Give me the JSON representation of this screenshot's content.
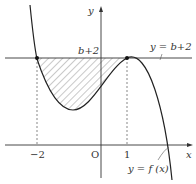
{
  "figure": {
    "axis_labels": {
      "x": "x",
      "y": "y",
      "origin": "O"
    },
    "x_ticks": [
      {
        "value": -2,
        "label": "−2"
      },
      {
        "value": 1,
        "label": "1"
      }
    ],
    "y_level_label": "b+2",
    "line_label": "y = b+2",
    "curve_label": "y = f (x)",
    "points": [
      {
        "x": -2,
        "y": "b+2"
      },
      {
        "x": 1,
        "y": "b+2"
      }
    ],
    "shaded_region": "between y=b+2 and y=f(x) for -2 ≤ x ≤ 1",
    "colors": {
      "ink": "#333333",
      "hatch": "#666666"
    }
  }
}
